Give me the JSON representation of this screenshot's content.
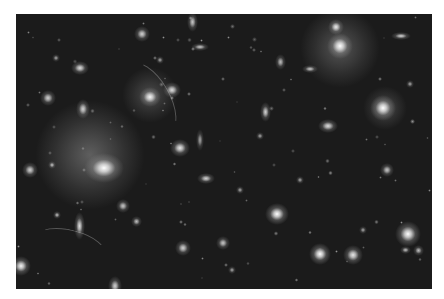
{
  "image": {
    "subject": "galaxy cluster deep field photograph",
    "colors": {
      "background": "#ffffff",
      "sky": "#1b1b1b",
      "glow": "#f5f5f5"
    },
    "frame": {
      "x": 16,
      "y": 14,
      "width": 416,
      "height": 275
    },
    "halos": [
      {
        "x": 90,
        "y": 155,
        "r": 55,
        "o": 0.35
      },
      {
        "x": 340,
        "y": 48,
        "r": 40,
        "o": 0.3
      },
      {
        "x": 150,
        "y": 95,
        "r": 28,
        "o": 0.25
      },
      {
        "x": 385,
        "y": 108,
        "r": 22,
        "o": 0.25
      }
    ],
    "galaxies": [
      {
        "x": 104,
        "y": 168,
        "w": 18,
        "h": 14,
        "b": 1.0
      },
      {
        "x": 340,
        "y": 46,
        "w": 12,
        "h": 12,
        "b": 1.0
      },
      {
        "x": 336,
        "y": 27,
        "w": 7,
        "h": 7,
        "b": 0.9
      },
      {
        "x": 383,
        "y": 108,
        "w": 12,
        "h": 12,
        "b": 1.0
      },
      {
        "x": 408,
        "y": 234,
        "w": 12,
        "h": 12,
        "b": 1.0
      },
      {
        "x": 150,
        "y": 97,
        "w": 10,
        "h": 9,
        "b": 0.95
      },
      {
        "x": 172,
        "y": 90,
        "w": 8,
        "h": 7,
        "b": 0.85
      },
      {
        "x": 180,
        "y": 148,
        "w": 9,
        "h": 8,
        "b": 0.9
      },
      {
        "x": 277,
        "y": 214,
        "w": 11,
        "h": 10,
        "b": 1.0
      },
      {
        "x": 320,
        "y": 254,
        "w": 10,
        "h": 10,
        "b": 1.0
      },
      {
        "x": 353,
        "y": 255,
        "w": 9,
        "h": 9,
        "b": 0.9
      },
      {
        "x": 328,
        "y": 126,
        "w": 9,
        "h": 6,
        "b": 0.85
      },
      {
        "x": 265,
        "y": 112,
        "w": 5,
        "h": 9,
        "b": 0.8
      },
      {
        "x": 79,
        "y": 226,
        "w": 5,
        "h": 13,
        "b": 0.85
      },
      {
        "x": 21,
        "y": 266,
        "w": 9,
        "h": 9,
        "b": 0.95
      },
      {
        "x": 30,
        "y": 170,
        "w": 7,
        "h": 7,
        "b": 0.8
      },
      {
        "x": 80,
        "y": 68,
        "w": 8,
        "h": 6,
        "b": 0.85
      },
      {
        "x": 83,
        "y": 109,
        "w": 6,
        "h": 9,
        "b": 0.8
      },
      {
        "x": 48,
        "y": 98,
        "w": 7,
        "h": 7,
        "b": 0.8
      },
      {
        "x": 142,
        "y": 34,
        "w": 7,
        "h": 7,
        "b": 0.8
      },
      {
        "x": 192,
        "y": 22,
        "w": 5,
        "h": 9,
        "b": 0.75
      },
      {
        "x": 200,
        "y": 47,
        "w": 8,
        "h": 4,
        "b": 0.75
      },
      {
        "x": 401,
        "y": 36,
        "w": 9,
        "h": 4,
        "b": 0.8
      },
      {
        "x": 310,
        "y": 69,
        "w": 7,
        "h": 4,
        "b": 0.75
      },
      {
        "x": 206,
        "y": 178,
        "w": 8,
        "h": 5,
        "b": 0.8
      },
      {
        "x": 183,
        "y": 248,
        "w": 7,
        "h": 7,
        "b": 0.8
      },
      {
        "x": 123,
        "y": 206,
        "w": 6,
        "h": 6,
        "b": 0.75
      },
      {
        "x": 136,
        "y": 221,
        "w": 5,
        "h": 5,
        "b": 0.7
      },
      {
        "x": 52,
        "y": 165,
        "w": 4,
        "h": 4,
        "b": 0.7
      },
      {
        "x": 57,
        "y": 215,
        "w": 4,
        "h": 4,
        "b": 0.7
      },
      {
        "x": 223,
        "y": 243,
        "w": 6,
        "h": 6,
        "b": 0.75
      },
      {
        "x": 387,
        "y": 170,
        "w": 6,
        "h": 6,
        "b": 0.75
      },
      {
        "x": 405,
        "y": 250,
        "w": 5,
        "h": 4,
        "b": 0.7
      },
      {
        "x": 418,
        "y": 250,
        "w": 5,
        "h": 5,
        "b": 0.7
      },
      {
        "x": 260,
        "y": 136,
        "w": 4,
        "h": 4,
        "b": 0.6
      },
      {
        "x": 410,
        "y": 84,
        "w": 4,
        "h": 4,
        "b": 0.6
      },
      {
        "x": 240,
        "y": 190,
        "w": 4,
        "h": 4,
        "b": 0.6
      },
      {
        "x": 300,
        "y": 180,
        "w": 4,
        "h": 4,
        "b": 0.6
      },
      {
        "x": 363,
        "y": 230,
        "w": 4,
        "h": 4,
        "b": 0.6
      },
      {
        "x": 115,
        "y": 286,
        "w": 6,
        "h": 9,
        "b": 0.8
      },
      {
        "x": 232,
        "y": 270,
        "w": 4,
        "h": 4,
        "b": 0.6
      },
      {
        "x": 280,
        "y": 62,
        "w": 5,
        "h": 7,
        "b": 0.7
      },
      {
        "x": 160,
        "y": 60,
        "w": 4,
        "h": 4,
        "b": 0.6
      },
      {
        "x": 56,
        "y": 58,
        "w": 4,
        "h": 4,
        "b": 0.6
      },
      {
        "x": 200,
        "y": 140,
        "w": 4,
        "h": 10,
        "b": 0.6
      }
    ],
    "arcs": [
      {
        "x": 148,
        "y": 98,
        "w": 80,
        "h": 40,
        "rot": 60
      },
      {
        "x": 70,
        "y": 245,
        "w": 70,
        "h": 30,
        "rot": 15
      }
    ]
  }
}
